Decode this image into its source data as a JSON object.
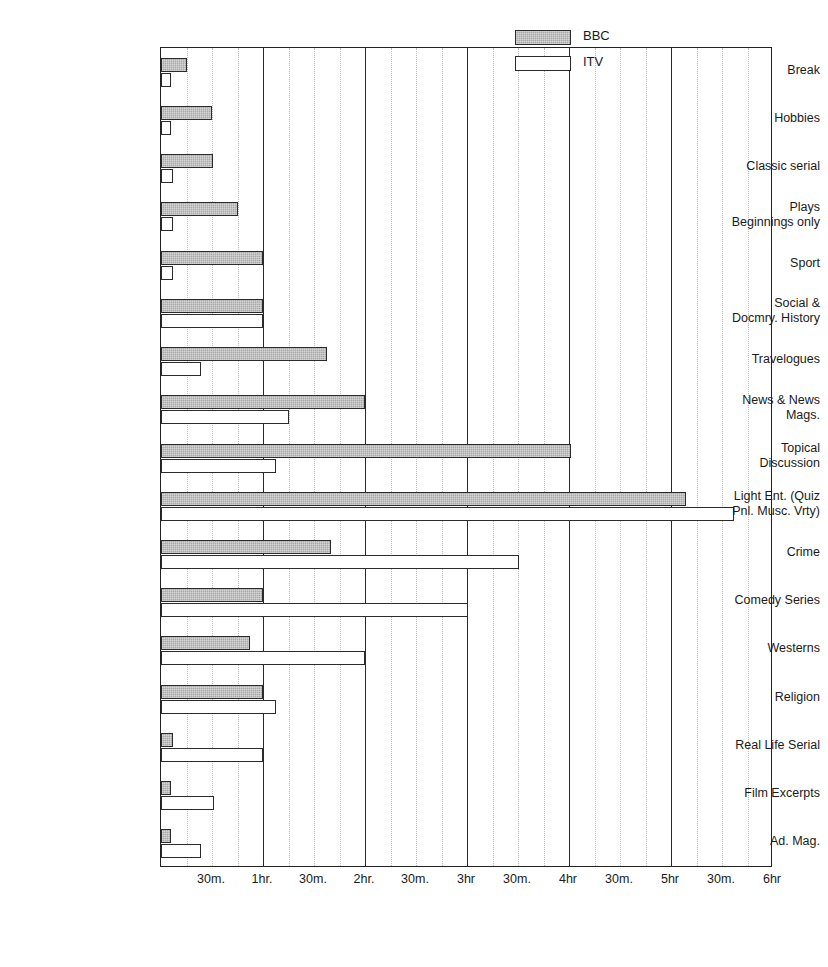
{
  "chart_data": {
    "type": "bar",
    "orientation": "horizontal",
    "title": "",
    "xlabel": "",
    "ylabel": "",
    "xlim_hours": [
      0,
      6
    ],
    "grid": true,
    "legend_position": "top-right",
    "x_ticks": [
      {
        "label": "30m.",
        "hours": 0.5,
        "major": false
      },
      {
        "label": "1hr.",
        "hours": 1.0,
        "major": true
      },
      {
        "label": "30m.",
        "hours": 1.5,
        "major": false
      },
      {
        "label": "2hr.",
        "hours": 2.0,
        "major": true
      },
      {
        "label": "30m.",
        "hours": 2.5,
        "major": false
      },
      {
        "label": "3hr",
        "hours": 3.0,
        "major": true
      },
      {
        "label": "30m.",
        "hours": 3.5,
        "major": false
      },
      {
        "label": "4hr",
        "hours": 4.0,
        "major": true
      },
      {
        "label": "30m.",
        "hours": 4.5,
        "major": false
      },
      {
        "label": "5hr",
        "hours": 5.0,
        "major": true
      },
      {
        "label": "30m.",
        "hours": 5.5,
        "major": false
      },
      {
        "label": "6hr",
        "hours": 6.0,
        "major": false
      }
    ],
    "minor_gridlines_hours": [
      0.25,
      0.5,
      0.75,
      1.25,
      1.5,
      1.75,
      2.25,
      2.5,
      2.75,
      3.25,
      3.5,
      3.75,
      4.25,
      4.5,
      4.75,
      5.25,
      5.5,
      5.75
    ],
    "major_gridlines_hours": [
      1,
      2,
      3,
      4,
      5
    ],
    "categories": [
      {
        "line1": "Break",
        "line2": ""
      },
      {
        "line1": "Hobbies",
        "line2": ""
      },
      {
        "line1": "Classic serial",
        "line2": ""
      },
      {
        "line1": "Plays",
        "line2": "Beginnings only"
      },
      {
        "line1": "Sport",
        "line2": ""
      },
      {
        "line1": "Social &",
        "line2": "Docmry. History"
      },
      {
        "line1": "Travelogues",
        "line2": ""
      },
      {
        "line1": "News & News",
        "line2": "Mags."
      },
      {
        "line1": "Topical",
        "line2": "Discussion"
      },
      {
        "line1": "Light Ent. (Quiz",
        "line2": "Pnl. Musc. Vrty)"
      },
      {
        "line1": "Crime",
        "line2": ""
      },
      {
        "line1": "Comedy Series",
        "line2": ""
      },
      {
        "line1": "Westerns",
        "line2": ""
      },
      {
        "line1": "Religion",
        "line2": ""
      },
      {
        "line1": "Real Life Serial",
        "line2": ""
      },
      {
        "line1": "Film Excerpts",
        "line2": ""
      },
      {
        "line1": "Ad. Mag.",
        "line2": ""
      }
    ],
    "series": [
      {
        "name": "BBC",
        "color": "#a8a8a8",
        "values": [
          0.25,
          0.5,
          0.51,
          0.75,
          1.0,
          1.0,
          1.63,
          2.0,
          4.02,
          5.15,
          1.67,
          1.0,
          0.87,
          1.0,
          0.12,
          0.1,
          0.1
        ]
      },
      {
        "name": "ITV",
        "color": "#ffffff",
        "values": [
          0.1,
          0.1,
          0.12,
          0.12,
          0.12,
          1.0,
          0.39,
          1.25,
          1.13,
          5.62,
          3.51,
          3.01,
          2.0,
          1.13,
          1.0,
          0.52,
          0.39
        ]
      }
    ]
  },
  "legend": {
    "items": [
      {
        "label": "BBC",
        "style": "bbc"
      },
      {
        "label": "ITV",
        "style": "itv"
      }
    ]
  }
}
